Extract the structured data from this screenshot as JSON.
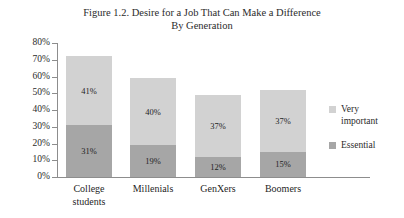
{
  "figure": {
    "title_lines": [
      "Figure 1.2. Desire for a Job That Can Make a Difference",
      "By Generation"
    ]
  },
  "chart_data": {
    "type": "bar",
    "stacked": true,
    "title": "Figure 1.2. Desire for a Job That Can Make a Difference By Generation",
    "xlabel": "",
    "ylabel": "",
    "ylim": [
      0,
      80
    ],
    "ytick_labels": [
      "80%",
      "70%",
      "60%",
      "50%",
      "40%",
      "30%",
      "20%",
      "10%",
      "0%"
    ],
    "ytick_values": [
      80,
      70,
      60,
      50,
      40,
      30,
      20,
      10,
      0
    ],
    "grid": false,
    "legend_position": "right",
    "categories": [
      "College students",
      "Millenials",
      "GenXers",
      "Boomers"
    ],
    "category_label_lines": [
      [
        "College",
        "students"
      ],
      [
        "Millenials"
      ],
      [
        "GenXers"
      ],
      [
        "Boomers"
      ]
    ],
    "series": [
      {
        "name": "Very important",
        "color": "#d2d2d2",
        "values": [
          41,
          40,
          37,
          37
        ],
        "labels": [
          "41%",
          "40%",
          "37%",
          "37%"
        ]
      },
      {
        "name": "Essential",
        "color": "#a6a6a6",
        "values": [
          31,
          19,
          12,
          15
        ],
        "labels": [
          "31%",
          "19%",
          "12%",
          "15%"
        ]
      }
    ],
    "totals": [
      72,
      59,
      49,
      52
    ]
  },
  "legend": {
    "entries": [
      {
        "label_lines": [
          "Very",
          "important"
        ],
        "swatch": "light"
      },
      {
        "label_lines": [
          "Essential"
        ],
        "swatch": "dark"
      }
    ]
  }
}
